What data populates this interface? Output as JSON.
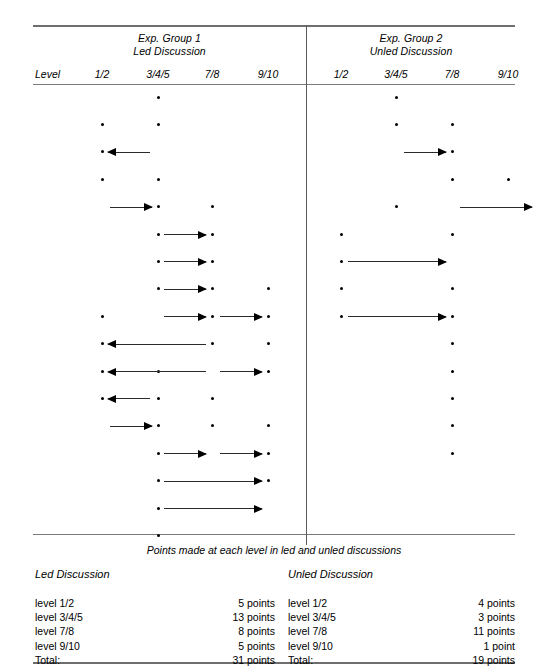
{
  "figure": {
    "faint_top_text": "",
    "caption": "Points made at each level in led and unled discussions",
    "level_label": "Level"
  },
  "groups": [
    {
      "name": "group-1",
      "title_line1": "Exp. Group 1",
      "title_line2": "Led Discussion",
      "columns": [
        "1/2",
        "3/4/5",
        "7/8",
        "9/10"
      ]
    },
    {
      "name": "group-2",
      "title_line1": "Exp. Group 2",
      "title_line2": "Unled Discussion",
      "columns": [
        "1/2",
        "3/4/5",
        "7/8",
        "9/10"
      ]
    }
  ],
  "summary": {
    "left": {
      "title": "Led Discussion",
      "rows": [
        {
          "label": "level 1/2",
          "value": "5 points"
        },
        {
          "label": "level 3/4/5",
          "value": "13 points"
        },
        {
          "label": "level 7/8",
          "value": "8 points"
        },
        {
          "label": "level 9/10",
          "value": "5 points"
        },
        {
          "label": "Total:",
          "value": "31 points"
        }
      ]
    },
    "right": {
      "title": "Unled Discussion",
      "rows": [
        {
          "label": "level 1/2",
          "value": "4 points"
        },
        {
          "label": "level 3/4/5",
          "value": "3 points"
        },
        {
          "label": "level 7/8",
          "value": "11 points"
        },
        {
          "label": "level 9/10",
          "value": "1 point"
        },
        {
          "label": "Total:",
          "value": "19 points"
        }
      ]
    }
  },
  "chart_data": {
    "type": "scatter",
    "title": "Points made at each level in led and unled discussions",
    "xlabel": "Level",
    "ylabel": "",
    "grid": false,
    "legend": "none",
    "panels": [
      {
        "name": "Exp. Group 1 — Led Discussion",
        "categories": [
          "1/2",
          "3/4/5",
          "7/8",
          "9/10"
        ],
        "column_x": [
          102,
          158,
          212,
          268
        ],
        "points": [
          {
            "row": 1,
            "level": "3/4/5"
          },
          {
            "row": 2,
            "level": "1/2"
          },
          {
            "row": 2,
            "level": "3/4/5"
          },
          {
            "row": 3,
            "level": "1/2"
          },
          {
            "row": 4,
            "level": "1/2"
          },
          {
            "row": 4,
            "level": "3/4/5"
          },
          {
            "row": 5,
            "level": "3/4/5"
          },
          {
            "row": 5,
            "level": "7/8"
          },
          {
            "row": 6,
            "level": "3/4/5"
          },
          {
            "row": 6,
            "level": "7/8"
          },
          {
            "row": 7,
            "level": "3/4/5"
          },
          {
            "row": 7,
            "level": "7/8"
          },
          {
            "row": 8,
            "level": "3/4/5"
          },
          {
            "row": 8,
            "level": "7/8"
          },
          {
            "row": 8,
            "level": "9/10"
          },
          {
            "row": 9,
            "level": "1/2"
          },
          {
            "row": 9,
            "level": "7/8"
          },
          {
            "row": 9,
            "level": "9/10"
          },
          {
            "row": 10,
            "level": "1/2"
          },
          {
            "row": 10,
            "level": "7/8"
          },
          {
            "row": 10,
            "level": "9/10"
          },
          {
            "row": 11,
            "level": "1/2"
          },
          {
            "row": 11,
            "level": "3/4/5"
          },
          {
            "row": 11,
            "level": "9/10"
          },
          {
            "row": 12,
            "level": "1/2"
          },
          {
            "row": 12,
            "level": "3/4/5"
          },
          {
            "row": 12,
            "level": "7/8"
          },
          {
            "row": 13,
            "level": "3/4/5"
          },
          {
            "row": 13,
            "level": "7/8"
          },
          {
            "row": 13,
            "level": "9/10"
          },
          {
            "row": 14,
            "level": "3/4/5"
          },
          {
            "row": 14,
            "level": "9/10"
          },
          {
            "row": 15,
            "level": "3/4/5"
          },
          {
            "row": 15,
            "level": "9/10"
          },
          {
            "row": 16,
            "level": "3/4/5"
          },
          {
            "row": 17,
            "level": "3/4/5"
          }
        ],
        "arrows": [
          {
            "row": 3,
            "x1": 150,
            "x2": 108,
            "dir": "left"
          },
          {
            "row": 5,
            "x1": 110,
            "x2": 152,
            "dir": "right"
          },
          {
            "row": 6,
            "x1": 164,
            "x2": 206,
            "dir": "right"
          },
          {
            "row": 7,
            "x1": 164,
            "x2": 206,
            "dir": "right"
          },
          {
            "row": 8,
            "x1": 164,
            "x2": 206,
            "dir": "right"
          },
          {
            "row": 9,
            "x1": 164,
            "x2": 206,
            "dir": "right"
          },
          {
            "row": 9,
            "x1": 220,
            "x2": 262,
            "dir": "right"
          },
          {
            "row": 10,
            "x1": 206,
            "x2": 108,
            "dir": "left"
          },
          {
            "row": 11,
            "x1": 206,
            "x2": 108,
            "dir": "left"
          },
          {
            "row": 11,
            "x1": 220,
            "x2": 262,
            "dir": "right"
          },
          {
            "row": 12,
            "x1": 150,
            "x2": 108,
            "dir": "left"
          },
          {
            "row": 13,
            "x1": 110,
            "x2": 152,
            "dir": "right"
          },
          {
            "row": 14,
            "x1": 164,
            "x2": 206,
            "dir": "right"
          },
          {
            "row": 14,
            "x1": 220,
            "x2": 262,
            "dir": "right"
          },
          {
            "row": 15,
            "x1": 164,
            "x2": 262,
            "dir": "right"
          },
          {
            "row": 16,
            "x1": 164,
            "x2": 262,
            "dir": "right"
          }
        ]
      },
      {
        "name": "Exp. Group 2 — Unled Discussion",
        "categories": [
          "1/2",
          "3/4/5",
          "7/8",
          "9/10"
        ],
        "column_x": [
          341,
          396,
          452,
          508
        ],
        "points": [
          {
            "row": 1,
            "level": "3/4/5"
          },
          {
            "row": 2,
            "level": "3/4/5"
          },
          {
            "row": 2,
            "level": "7/8"
          },
          {
            "row": 3,
            "level": "7/8"
          },
          {
            "row": 4,
            "level": "7/8"
          },
          {
            "row": 4,
            "level": "9/10"
          },
          {
            "row": 5,
            "level": "3/4/5"
          },
          {
            "row": 6,
            "level": "1/2"
          },
          {
            "row": 6,
            "level": "7/8"
          },
          {
            "row": 7,
            "level": "1/2"
          },
          {
            "row": 8,
            "level": "1/2"
          },
          {
            "row": 8,
            "level": "7/8"
          },
          {
            "row": 9,
            "level": "1/2"
          },
          {
            "row": 9,
            "level": "7/8"
          },
          {
            "row": 10,
            "level": "7/8"
          },
          {
            "row": 11,
            "level": "7/8"
          },
          {
            "row": 12,
            "level": "7/8"
          },
          {
            "row": 13,
            "level": "7/8"
          },
          {
            "row": 14,
            "level": "7/8"
          }
        ],
        "arrows": [
          {
            "row": 3,
            "x1": 404,
            "x2": 446,
            "dir": "right"
          },
          {
            "row": 5,
            "x1": 460,
            "x2": 532,
            "dir": "right"
          },
          {
            "row": 7,
            "x1": 348,
            "x2": 446,
            "dir": "right"
          },
          {
            "row": 9,
            "x1": 348,
            "x2": 446,
            "dir": "right"
          }
        ]
      }
    ],
    "row_y_start": 97,
    "row_pitch": 27.4,
    "summary_table": {
      "type": "table",
      "columns": [
        "Level",
        "Led Discussion",
        "Unled Discussion"
      ],
      "rows": [
        [
          "level 1/2",
          5,
          4
        ],
        [
          "level 3/4/5",
          13,
          3
        ],
        [
          "level 7/8",
          8,
          11
        ],
        [
          "level 9/10",
          5,
          1
        ],
        [
          "Total",
          31,
          19
        ]
      ]
    }
  }
}
